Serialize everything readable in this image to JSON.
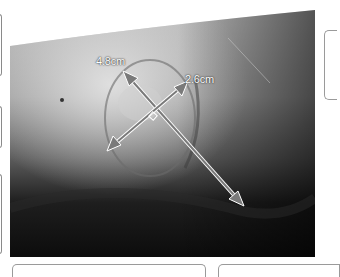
{
  "figure": {
    "type": "clinical-wound-photograph",
    "measurements": [
      {
        "label": "4.8cm",
        "axis": "length"
      },
      {
        "label": "2.6cm",
        "axis": "width"
      }
    ],
    "right_angle_marker": true,
    "colors": {
      "arrow_fill": "#7a7a7a",
      "arrow_stroke": "#ffffff",
      "frame": "#9a9a9a"
    }
  }
}
